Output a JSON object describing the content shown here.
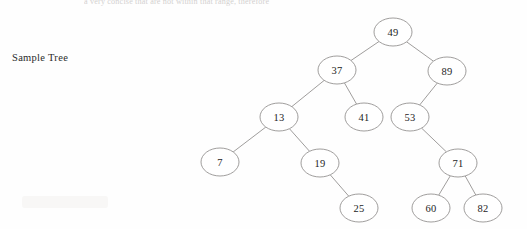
{
  "page": {
    "top_cut_text": "a very concise that are not within that range, therefore",
    "caption": "Sample Tree",
    "background_color": "#fefefe",
    "node_fill_color": "#ffffff",
    "node_stroke_color": "#8e8b8a",
    "edge_color": "#8e8b8a",
    "text_color": "#1d1d1d"
  },
  "chart_data": {
    "type": "diagram",
    "diagram_kind": "binary-search-tree",
    "title": "Sample Tree",
    "node_radius_x": 19,
    "node_radius_y": 14,
    "root": "49",
    "nodes": [
      {
        "id": "n49",
        "label": "49",
        "x": 393,
        "y": 32,
        "depth": 0
      },
      {
        "id": "n37",
        "label": "37",
        "x": 337,
        "y": 70,
        "depth": 1
      },
      {
        "id": "n89",
        "label": "89",
        "x": 447,
        "y": 71,
        "depth": 1
      },
      {
        "id": "n13",
        "label": "13",
        "x": 279,
        "y": 117,
        "depth": 2
      },
      {
        "id": "n41",
        "label": "41",
        "x": 364,
        "y": 117,
        "depth": 2
      },
      {
        "id": "n53",
        "label": "53",
        "x": 410,
        "y": 117,
        "depth": 2
      },
      {
        "id": "n7",
        "label": "7",
        "x": 220,
        "y": 162,
        "depth": 3
      },
      {
        "id": "n19",
        "label": "19",
        "x": 320,
        "y": 163,
        "depth": 3
      },
      {
        "id": "n71",
        "label": "71",
        "x": 458,
        "y": 163,
        "depth": 3
      },
      {
        "id": "n25",
        "label": "25",
        "x": 359,
        "y": 208,
        "depth": 4
      },
      {
        "id": "n60",
        "label": "60",
        "x": 431,
        "y": 208,
        "depth": 4
      },
      {
        "id": "n82",
        "label": "82",
        "x": 483,
        "y": 208,
        "depth": 4
      }
    ],
    "edges": [
      {
        "from": "n49",
        "to": "n37",
        "side": "left"
      },
      {
        "from": "n49",
        "to": "n89",
        "side": "right"
      },
      {
        "from": "n37",
        "to": "n13",
        "side": "left"
      },
      {
        "from": "n37",
        "to": "n41",
        "side": "right"
      },
      {
        "from": "n89",
        "to": "n53",
        "side": "left"
      },
      {
        "from": "n13",
        "to": "n7",
        "side": "left"
      },
      {
        "from": "n13",
        "to": "n19",
        "side": "right"
      },
      {
        "from": "n53",
        "to": "n71",
        "side": "right"
      },
      {
        "from": "n19",
        "to": "n25",
        "side": "right"
      },
      {
        "from": "n71",
        "to": "n60",
        "side": "left"
      },
      {
        "from": "n71",
        "to": "n82",
        "side": "right"
      }
    ]
  }
}
